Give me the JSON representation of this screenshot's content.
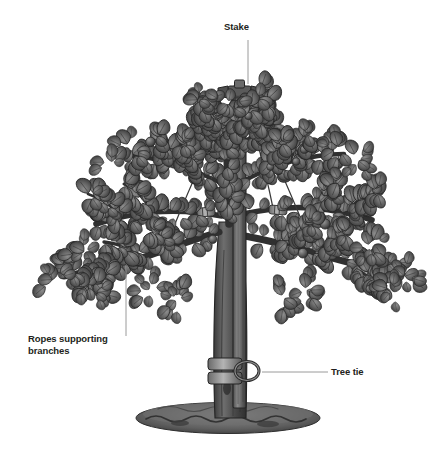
{
  "figure": {
    "background_color": "#ffffff",
    "ink_color": "#4a4a4a",
    "dark_ink": "#2e2e2e",
    "label_color": "#231f20",
    "leader_color": "#9a9a9a"
  },
  "labels": {
    "stake": "Stake",
    "ropes": "Ropes supporting\nbranches",
    "tree_tie": "Tree tie"
  },
  "parts": {
    "stake_name": "stake",
    "stake_cross_arm_name": "stake-cross-arm",
    "trunk_name": "tree-trunk",
    "canopy_name": "tree-canopy",
    "rope_name": "support-rope",
    "rope_sleeve_name": "rope-branch-sleeve",
    "tree_tie_name": "tree-tie-strap",
    "mulch_name": "mulch-mound"
  },
  "leaders": {
    "stake": "vertical",
    "ropes": "vertical",
    "tree_tie": "horizontal"
  }
}
